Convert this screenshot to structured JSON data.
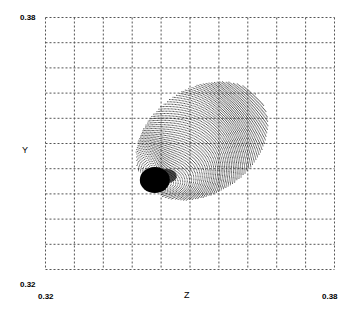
{
  "chart_data": {
    "type": "scatter",
    "title": "",
    "xlabel": "Z",
    "ylabel": "Y",
    "xlim": [
      0.32,
      0.38
    ],
    "ylim": [
      0.32,
      0.38
    ],
    "x_tick_labels": [
      "0.32",
      "0.38"
    ],
    "y_tick_labels": [
      "0.38",
      "0.32"
    ],
    "grid": {
      "on": true,
      "style": "dotted",
      "divisions_x": 10,
      "divisions_y": 10
    },
    "legend": null,
    "series": [
      {
        "name": "point cloud",
        "description": "Dense dotted ellipsoidal cloud of curved point arcs; very dark concentrated cluster at lower-left",
        "dense_core": {
          "z": 0.3428,
          "y": 0.3412
        },
        "extent": {
          "z_min": 0.338,
          "z_max": 0.367,
          "y_min": 0.336,
          "y_max": 0.365
        },
        "color": "#000000"
      }
    ]
  },
  "labels": {
    "y_top": "0.38",
    "y_bottom": "0.32",
    "x_left": "0.32",
    "x_right": "0.38",
    "x_axis": "Z",
    "y_axis": "Y"
  },
  "colors": {
    "grid": "#555555",
    "points": "#000000",
    "background": "#ffffff"
  }
}
